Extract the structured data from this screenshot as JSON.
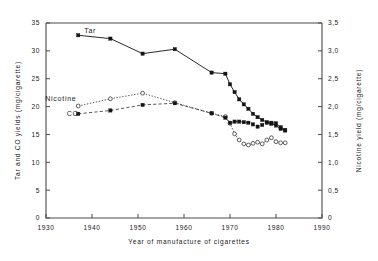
{
  "chart_data": {
    "type": "line",
    "title": "",
    "xlabel": "Year of manufacture of cigarettes",
    "ylabel": "Tar and CO yields (mg/cigarette)",
    "y2label": "Nicotine yield (mg/cigarette)",
    "xlim": [
      1930,
      1990
    ],
    "ylim": [
      0,
      35
    ],
    "y2lim": [
      0,
      3.5
    ],
    "xticks": [
      1930,
      1940,
      1950,
      1960,
      1970,
      1980,
      1990
    ],
    "xticklabels": [
      "1930",
      "1940",
      "1950",
      "1960",
      "1970",
      "1980",
      "1990"
    ],
    "yticks": [
      0,
      5,
      10,
      15,
      20,
      25,
      30,
      35
    ],
    "yticklabels": [
      "0",
      "5",
      "10",
      "15",
      "20",
      "25",
      "30",
      "35"
    ],
    "y2ticks": [
      0,
      0.5,
      1.0,
      1.5,
      2.0,
      2.5,
      3.0,
      3.5
    ],
    "y2ticklabels": [
      "0",
      "0,5",
      "1,0",
      "1,5",
      "2,0",
      "2,5",
      "3,0",
      "3,5"
    ],
    "grid": false,
    "legend_position": "inline-annotations",
    "series": [
      {
        "name": "Tar",
        "axis": "left",
        "unit": "mg/cigarette",
        "marker": "filled-square",
        "linestyle": "solid",
        "label_x": 1937.0,
        "label_y": 33.6,
        "x": [
          1937,
          1944,
          1951,
          1958,
          1966,
          1969,
          1970,
          1971,
          1972,
          1973,
          1974,
          1975,
          1976,
          1977,
          1978,
          1979,
          1980,
          1981,
          1982
        ],
        "y": [
          32.8,
          32.2,
          29.5,
          30.3,
          26.1,
          25.9,
          24.0,
          22.6,
          21.3,
          20.4,
          19.6,
          18.7,
          18.1,
          17.6,
          17.2,
          16.9,
          16.6,
          16.0,
          15.7
        ]
      },
      {
        "name": "Nicotine",
        "axis": "right",
        "unit": "mg/cigarette",
        "marker": "open-circle",
        "linestyle": "dotted",
        "label_x": 1937.5,
        "label_y": 21.4,
        "x": [
          1937,
          1944,
          1951,
          1958,
          1966,
          1969,
          1970,
          1971,
          1972,
          1973,
          1974,
          1975,
          1976,
          1977,
          1978,
          1979,
          1980,
          1981,
          1982
        ],
        "y_left_scale": [
          20.1,
          21.4,
          22.4,
          20.7,
          18.8,
          18.2,
          17.0,
          15.1,
          14.0,
          13.3,
          13.1,
          13.4,
          13.6,
          13.3,
          14.0,
          14.4,
          13.7,
          13.5,
          13.5
        ],
        "y_nicotine": [
          2.01,
          2.14,
          2.24,
          2.07,
          1.88,
          1.82,
          1.7,
          1.51,
          1.4,
          1.33,
          1.31,
          1.34,
          1.36,
          1.33,
          1.4,
          1.44,
          1.37,
          1.35,
          1.35
        ]
      },
      {
        "name": "CO",
        "axis": "left",
        "unit": "mg/cigarette",
        "marker": "filled-square",
        "linestyle": "dashed",
        "label_x": 1938.0,
        "label_y": 18.8,
        "x": [
          1937,
          1944,
          1951,
          1958,
          1966,
          1969,
          1970,
          1971,
          1972,
          1973,
          1974,
          1975,
          1976,
          1977,
          1978,
          1979,
          1980,
          1981,
          1982
        ],
        "y": [
          18.7,
          19.3,
          20.3,
          20.6,
          18.8,
          18.0,
          17.1,
          17.3,
          17.3,
          17.2,
          17.1,
          16.8,
          16.4,
          16.7,
          17.1,
          17.1,
          17.0,
          16.3,
          15.8
        ]
      }
    ]
  },
  "labels": {
    "tar": "Tar",
    "nicotine": "Nicotine",
    "co": "CO"
  }
}
